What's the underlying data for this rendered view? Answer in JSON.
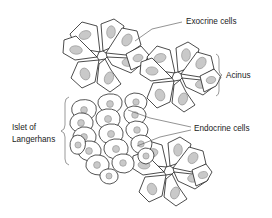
{
  "diagram": {
    "background_color": "#ffffff",
    "line_color": "#1f1f1f",
    "nucleus_color": "#c9c9c9",
    "nucleus_outline_color": "#8e8e8e",
    "leader_color": "#5a5a5a",
    "text_color": "#1a1a1a"
  },
  "labels": {
    "exocrine": "Exocrine cells",
    "acinus": "Acinus",
    "endocrine": "Endocrine cells",
    "islet_line1": "Islet of",
    "islet_line2": "Langerhans"
  },
  "structures": {
    "acini": [
      {
        "name": "acinus-top-left",
        "center_x": 103,
        "center_y": 55,
        "cell_count": 8
      },
      {
        "name": "acinus-top-right",
        "center_x": 178,
        "center_y": 76,
        "cell_count": 8
      },
      {
        "name": "acinus-bottom",
        "center_x": 170,
        "center_y": 170,
        "cell_count": 8
      }
    ],
    "islet": {
      "name": "islet-of-langerhans",
      "center_x": 110,
      "center_y": 135,
      "cell_count": 17
    }
  }
}
